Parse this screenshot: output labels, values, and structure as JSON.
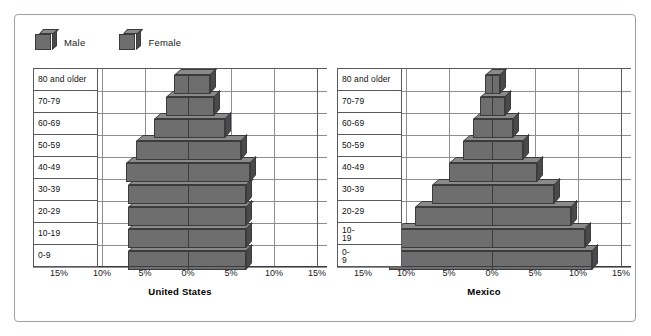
{
  "legend": {
    "items": [
      {
        "label": "Male",
        "icon": "cube-icon",
        "color": "#6e6e6e"
      },
      {
        "label": "Female",
        "icon": "cube-icon",
        "color": "#6e6e6e"
      }
    ]
  },
  "colors": {
    "bar_front": "#6e6e6e",
    "bar_top": "#8a8a8a",
    "bar_side": "#4a4a4a",
    "bar_edge": "#3b3b3b",
    "grid": "#8d8d93",
    "frame": "#9aa0a6",
    "axis": "#3a3a3f"
  },
  "chart_data": [
    {
      "type": "bar",
      "subtype": "population-pyramid",
      "title": "United States",
      "xlabel": "",
      "ylabel": "",
      "categories": [
        "0-9",
        "10-19",
        "20-29",
        "30-39",
        "40-49",
        "50-59",
        "60-69",
        "70-79",
        "80 and older"
      ],
      "xlim": [
        -15,
        15
      ],
      "xticks": [
        "15%",
        "10%",
        "5%",
        "0%",
        "5%",
        "10%",
        "15%"
      ],
      "xtick_values": [
        -15,
        -10,
        -5,
        0,
        5,
        10,
        15
      ],
      "grid": true,
      "legend_position": "top-left",
      "series": [
        {
          "name": "Male",
          "side": "left",
          "values": [
            7.0,
            7.0,
            7.0,
            7.0,
            7.2,
            6.0,
            4.0,
            2.6,
            1.6
          ]
        },
        {
          "name": "Female",
          "side": "right",
          "values": [
            6.7,
            6.7,
            6.8,
            6.8,
            7.2,
            6.2,
            4.3,
            3.0,
            2.6
          ]
        }
      ]
    },
    {
      "type": "bar",
      "subtype": "population-pyramid",
      "title": "Mexico",
      "xlabel": "",
      "ylabel": "",
      "categories": [
        "0-\n9",
        "10-\n19",
        "20-29",
        "30-39",
        "40-49",
        "50-59",
        "60-69",
        "70-79",
        "80 and older"
      ],
      "xlim": [
        -15,
        15
      ],
      "xticks": [
        "15%",
        "10%",
        "5%",
        "0%",
        "5%",
        "10%",
        "15%"
      ],
      "xtick_values": [
        -15,
        -10,
        -5,
        0,
        5,
        10,
        15
      ],
      "grid": true,
      "legend_position": "top-left",
      "series": [
        {
          "name": "Male",
          "side": "left",
          "values": [
            12.0,
            11.0,
            9.0,
            7.0,
            5.0,
            3.4,
            2.2,
            1.4,
            0.8
          ]
        },
        {
          "name": "Female",
          "side": "right",
          "values": [
            11.6,
            10.8,
            9.2,
            7.2,
            5.2,
            3.6,
            2.4,
            1.5,
            0.9
          ]
        }
      ]
    }
  ]
}
